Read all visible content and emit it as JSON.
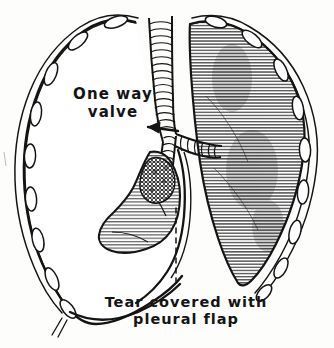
{
  "figure": {
    "background_color": "#fdfdfb",
    "ink_color": "#141414",
    "style": "pen-and-ink line drawing with horizontal hatching"
  },
  "annotations": {
    "one_way_valve": {
      "line1": "One way",
      "line2": "valve",
      "pointer": "arrow pointing right-to-left at bronchial tear"
    },
    "tear_caption": {
      "line1": "Tear covered with",
      "line2": "pleural flap",
      "pointer": "vertical dashed leader line"
    }
  },
  "anatomy": [
    {
      "name": "left-hemithorax-cavity",
      "shading": "none",
      "note": "air-filled pleural space, collapsed lung"
    },
    {
      "name": "left-lung-collapsed",
      "shading": "horizontal-hatch",
      "note": "small collapsed lung near hilum"
    },
    {
      "name": "right-lung-inflated",
      "shading": "dense-horizontal-hatch"
    },
    {
      "name": "trachea",
      "shading": "cartilage-rings"
    },
    {
      "name": "left-main-bronchus",
      "shading": "cartilage-rings"
    },
    {
      "name": "right-main-bronchus",
      "shading": "cartilage-rings"
    },
    {
      "name": "rib-cage-left",
      "shading": "rib-oval-cross-sections"
    },
    {
      "name": "rib-cage-right",
      "shading": "rib-oval-cross-sections"
    },
    {
      "name": "diaphragm",
      "shading": "outline"
    },
    {
      "name": "tear-site",
      "shading": "cross-hatch"
    }
  ]
}
